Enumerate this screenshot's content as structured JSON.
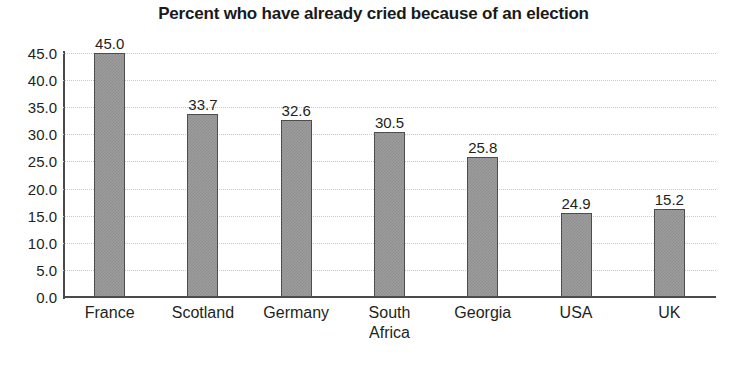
{
  "chart_data": {
    "type": "bar",
    "title": "Percent who have already cried because of an election",
    "xlabel": "",
    "ylabel": "",
    "categories": [
      "France",
      "Scotland",
      "Germany",
      "South\nAfrica",
      "Georgia",
      "USA",
      "UK"
    ],
    "values": [
      45.0,
      33.7,
      32.6,
      30.5,
      25.8,
      24.9,
      15.2
    ],
    "value_labels": [
      "45.0",
      "33.7",
      "32.6",
      "30.5",
      "25.8",
      "24.9",
      "15.2"
    ],
    "drawn_heights": [
      45.0,
      33.7,
      32.6,
      30.5,
      25.8,
      15.5,
      16.2
    ],
    "ylim": [
      0.0,
      45.0
    ],
    "ytick_step": 5.0,
    "ytick_labels": [
      "45.0",
      "40.0",
      "35.0",
      "30.0",
      "25.0",
      "20.0",
      "15.0",
      "10.0",
      "5.0",
      "0.0"
    ],
    "ytick_values": [
      45.0,
      40.0,
      35.0,
      30.0,
      25.0,
      20.0,
      15.0,
      10.0,
      5.0,
      0.0
    ],
    "grid": true,
    "grid_style": "dotted",
    "legend": null,
    "bar_fill_color": "#9d9d9d",
    "bar_edge_color": "#4d4d4d",
    "axis_color": "#4a4a4a",
    "grid_color": "#c9c9c9",
    "text_color": "#231f20",
    "background_color": "#ffffff"
  }
}
